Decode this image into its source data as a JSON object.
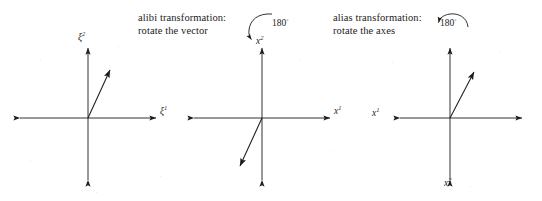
{
  "figure": {
    "background_color": "#ffffff",
    "line_color": "#1c1c1c"
  },
  "panels": [
    {
      "id": "original",
      "caption_lines": [],
      "angle_label": "",
      "axis_labels": {
        "horizontal": "ξ",
        "horizontal_sup": "1",
        "horizontal_position": "right",
        "vertical": "ξ",
        "vertical_sup": "2",
        "vertical_position": "top"
      },
      "vector_direction": "up-right"
    },
    {
      "id": "alibi",
      "caption_lines": [
        "alibi transformation:",
        "rotate the vector"
      ],
      "angle_label": "180",
      "angle_label_sup": "◦",
      "axis_labels": {
        "horizontal": "x",
        "horizontal_sup": "1",
        "horizontal_position": "right",
        "vertical": "x",
        "vertical_sup": "2",
        "vertical_position": "top"
      },
      "vector_direction": "down-left"
    },
    {
      "id": "alias",
      "caption_lines": [
        "alias transformation:",
        "rotate the axes"
      ],
      "angle_label": "180",
      "angle_label_sup": "◦",
      "axis_labels": {
        "horizontal": "x",
        "horizontal_sup": "1",
        "horizontal_position": "left",
        "vertical": "x",
        "vertical_sup": "2",
        "vertical_position": "bottom"
      },
      "vector_direction": "up-right"
    }
  ],
  "labels": {
    "xi1_panel1": "ξ",
    "xi1_panel1_sup": "1",
    "xi2_panel1": "ξ",
    "xi2_panel1_sup": "2",
    "x1_panel2": "x",
    "x1_panel2_sup": "1",
    "x2_panel2": "x",
    "x2_panel2_sup": "2",
    "x1_panel3": "x",
    "x1_panel3_sup": "1",
    "x2_panel3": "x",
    "x2_panel3_sup": "2",
    "angle_alibi": "180",
    "angle_alibi_sup": "◦",
    "angle_alias": "180",
    "angle_alias_sup": "◦"
  },
  "captions": {
    "alibi_line1": "alibi transformation:",
    "alibi_line2": "rotate the vector",
    "alias_line1": "alias transformation:",
    "alias_line2": "rotate the axes"
  }
}
